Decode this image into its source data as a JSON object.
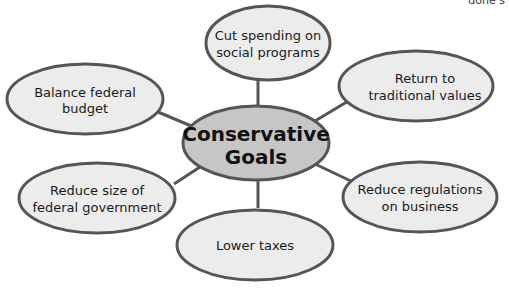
{
  "corner_text": "done s",
  "colors": {
    "stroke": "#555555",
    "node_fill": "#ececec",
    "center_fill": "#c6c6c6",
    "background": "#ffffff"
  },
  "center": {
    "line1": "Conservative",
    "line2": "Goals"
  },
  "nodes": [
    {
      "id": "cut-spending",
      "line1": "Cut spending on",
      "line2": "social programs"
    },
    {
      "id": "traditional-values",
      "line1": "Return to",
      "line2": "traditional values"
    },
    {
      "id": "reduce-regulations",
      "line1": "Reduce regulations",
      "line2": "on business"
    },
    {
      "id": "lower-taxes",
      "line1": "Lower taxes",
      "line2": ""
    },
    {
      "id": "reduce-government",
      "line1": "Reduce size of",
      "line2": "federal government"
    },
    {
      "id": "balance-budget",
      "line1": "Balance federal",
      "line2": "budget"
    }
  ]
}
